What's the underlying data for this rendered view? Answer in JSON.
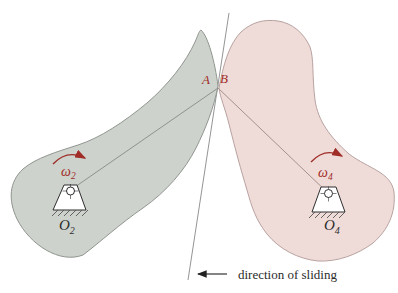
{
  "figure": {
    "labels": {
      "contact_a": "A",
      "contact_b": "B",
      "omega2": {
        "base": "ω",
        "sub": "2"
      },
      "omega4": {
        "base": "ω",
        "sub": "4"
      },
      "pivot2": {
        "base": "O",
        "sub": "2"
      },
      "pivot4": {
        "base": "O",
        "sub": "4"
      },
      "sliding_caption": "direction of sliding"
    },
    "colors": {
      "body2_fill": "#cdd2cc",
      "body2_stroke": "#90968f",
      "body4_fill": "#efdcd9",
      "body4_stroke": "#b8a2a0",
      "radius_line_2": "#8f938b",
      "radius_line_4": "#a8908c",
      "tangent_line": "#787878",
      "accent_red": "#a02d28",
      "text_dark": "#2b2b2b",
      "pivot_stroke": "#2e2e2e",
      "arrow_black": "#222222"
    }
  }
}
